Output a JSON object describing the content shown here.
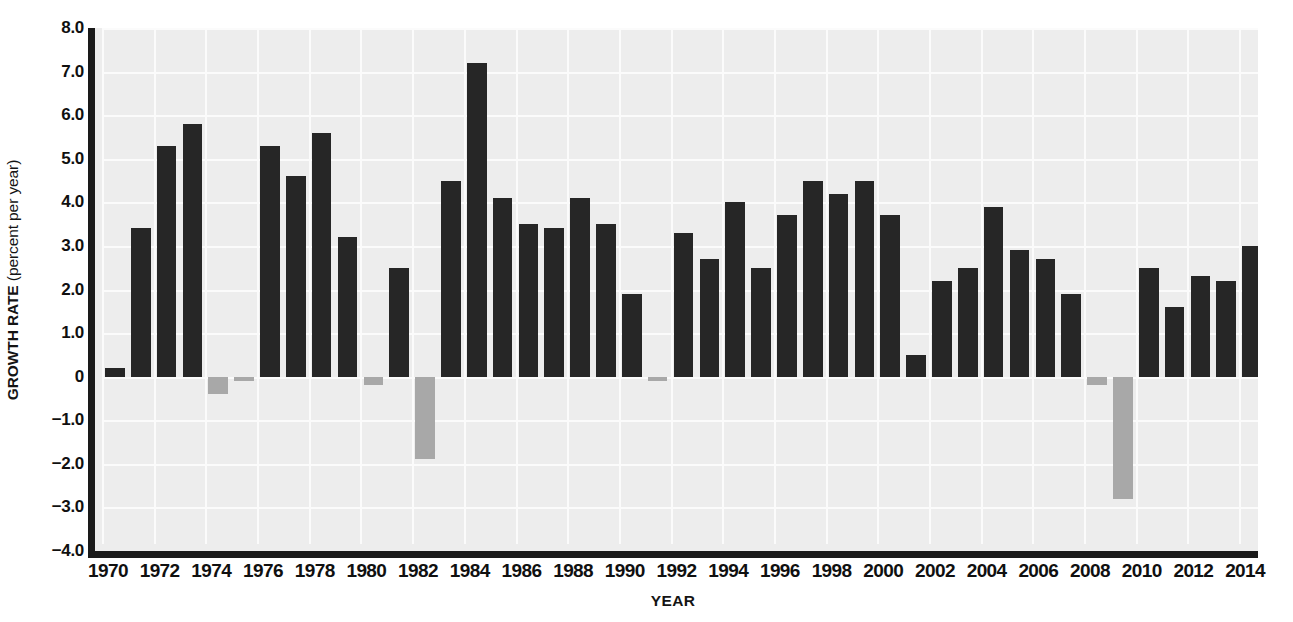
{
  "chart_data": {
    "type": "bar",
    "title": "",
    "subtitle": "",
    "xlabel": "YEAR",
    "ylabel": "GROWTH RATE (percent per year)",
    "ylabel_strong": "GROWTH RATE",
    "ylabel_rest": " (percent per year)",
    "ylim": [
      -4.0,
      8.0
    ],
    "xlim": [
      1969.5,
      2014.5
    ],
    "ytick_labels": [
      "8.0",
      "7.0",
      "6.0",
      "5.0",
      "4.0",
      "3.0",
      "2.0",
      "1.0",
      "0",
      "−1.0",
      "−2.0",
      "−3.0",
      "−4.0"
    ],
    "ytick_values": [
      8,
      7,
      6,
      5,
      4,
      3,
      2,
      1,
      0,
      -1,
      -2,
      -3,
      -4
    ],
    "xtick_labels": [
      "1970",
      "1972",
      "1974",
      "1976",
      "1978",
      "1980",
      "1982",
      "1984",
      "1986",
      "1988",
      "1990",
      "1992",
      "1994",
      "1996",
      "1998",
      "2000",
      "2002",
      "2004",
      "2006",
      "2008",
      "2010",
      "2012",
      "2014"
    ],
    "xtick_values": [
      1970,
      1972,
      1974,
      1976,
      1978,
      1980,
      1982,
      1984,
      1986,
      1988,
      1990,
      1992,
      1994,
      1996,
      1998,
      2000,
      2002,
      2004,
      2006,
      2008,
      2010,
      2012,
      2014
    ],
    "grid": true,
    "grid_color": "#fbfbfb",
    "plot_background": "#ededed",
    "legend": "none",
    "positive_color": "#262626",
    "negative_color": "#a8a8a8",
    "axis_color": "#1a1a1a",
    "categories": [
      1970,
      1971,
      1972,
      1973,
      1974,
      1975,
      1976,
      1977,
      1978,
      1979,
      1980,
      1981,
      1982,
      1983,
      1984,
      1985,
      1986,
      1987,
      1988,
      1989,
      1990,
      1991,
      1992,
      1993,
      1994,
      1995,
      1996,
      1997,
      1998,
      1999,
      2000,
      2001,
      2002,
      2003,
      2004,
      2005,
      2006,
      2007,
      2008,
      2009,
      2010,
      2011,
      2012,
      2013,
      2014
    ],
    "values": [
      0.2,
      3.4,
      5.3,
      5.8,
      -0.4,
      -0.1,
      5.3,
      4.6,
      5.6,
      3.2,
      -0.2,
      2.5,
      -1.9,
      4.5,
      7.2,
      4.1,
      3.5,
      3.4,
      4.1,
      3.5,
      1.9,
      -0.1,
      3.3,
      2.7,
      4.0,
      2.5,
      3.7,
      4.5,
      4.2,
      4.5,
      3.7,
      0.5,
      2.2,
      2.5,
      3.9,
      2.9,
      2.7,
      1.9,
      -0.2,
      -2.8,
      2.5,
      1.6,
      2.3,
      2.2,
      3.0
    ]
  }
}
